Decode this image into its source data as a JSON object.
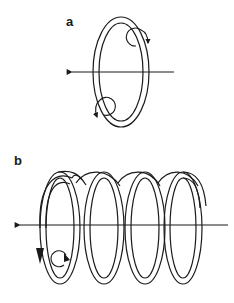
{
  "figure": {
    "panels": [
      {
        "label": "a",
        "description": "Single current loop (ring) with axial arrow pointing left and circulating field arrows around the wire"
      },
      {
        "label": "b",
        "description": "Helical coil (solenoid) with axial arrow pointing left, arrow showing current direction and circulating field arrow around the wire"
      }
    ]
  },
  "colors": {
    "stroke": "#1a1a1a",
    "background": "#ffffff"
  }
}
